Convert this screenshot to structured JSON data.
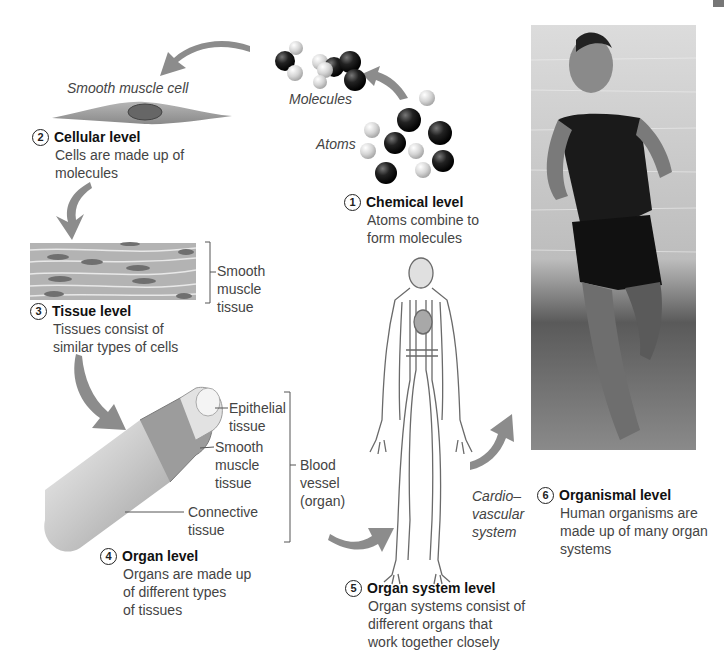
{
  "levels": [
    {
      "number": "1",
      "title": "Chemical level",
      "desc_lines": [
        "Atoms combine to",
        "form molecules"
      ]
    },
    {
      "number": "2",
      "title": "Cellular level",
      "desc_lines": [
        "Cells are made up of",
        "molecules"
      ]
    },
    {
      "number": "3",
      "title": "Tissue level",
      "desc_lines": [
        "Tissues consist of",
        "similar types of cells"
      ]
    },
    {
      "number": "4",
      "title": "Organ level",
      "desc_lines": [
        "Organs are made up",
        "of different types",
        "of tissues"
      ]
    },
    {
      "number": "5",
      "title": "Organ system level",
      "desc_lines": [
        "Organ systems consist of",
        "different organs that",
        "work together closely"
      ]
    },
    {
      "number": "6",
      "title": "Organismal level",
      "desc_lines": [
        "Human organisms are",
        "made up of many organ",
        "systems"
      ]
    }
  ],
  "italic_labels": {
    "smooth_muscle_cell": "Smooth muscle cell",
    "molecules": "Molecules",
    "atoms": "Atoms",
    "cardiovascular": [
      "Cardio–",
      "vascular",
      "system"
    ]
  },
  "callouts": {
    "smooth_muscle_tissue": [
      "Smooth",
      "muscle",
      "tissue"
    ],
    "epithelial_tissue": [
      "Epithelial",
      "tissue"
    ],
    "smooth_muscle_tissue_organ": [
      "Smooth",
      "muscle",
      "tissue"
    ],
    "connective_tissue": [
      "Connective",
      "tissue"
    ],
    "blood_vessel": [
      "Blood",
      "vessel",
      "(organ)"
    ]
  },
  "colors": {
    "arrow": "#8c8c8c",
    "atom_dark": "#1a1a1a",
    "atom_light": "#d0d0d0",
    "cell": "#9a9a9a",
    "text_title": "#111111",
    "text_body": "#444444"
  }
}
